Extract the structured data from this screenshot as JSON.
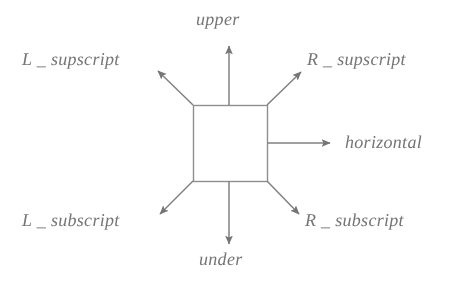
{
  "figure": {
    "background_color": "#ffffff",
    "ink_color": "#6e6e6e",
    "center_shape": {
      "kind": "square",
      "x": 193,
      "y": 105,
      "width": 74,
      "height": 76,
      "fill": "none"
    },
    "labels": {
      "upper": "upper",
      "under": "under",
      "horizontal": "horizontal",
      "left_supscript": "L _ supscript",
      "right_supscript": "R _ supscript",
      "left_subscript": "L _ subscript",
      "right_subscript": "R _ subscript"
    },
    "arrows": [
      {
        "name": "upper-arrow",
        "direction": "up",
        "from_x": 229,
        "from_y": 105,
        "to_x": 229,
        "to_y": 44
      },
      {
        "name": "under-arrow",
        "direction": "down",
        "from_x": 229,
        "from_y": 181,
        "to_x": 229,
        "to_y": 246
      },
      {
        "name": "horizontal-arrow",
        "direction": "right",
        "from_x": 267,
        "from_y": 143,
        "to_x": 332,
        "to_y": 143
      },
      {
        "name": "left-supscript-arrow",
        "direction": "up-left",
        "from_x": 193,
        "from_y": 105,
        "to_x": 156,
        "to_y": 69
      },
      {
        "name": "right-supscript-arrow",
        "direction": "up-right",
        "from_x": 267,
        "from_y": 105,
        "to_x": 303,
        "to_y": 70
      },
      {
        "name": "left-subscript-arrow",
        "direction": "down-left",
        "from_x": 193,
        "from_y": 181,
        "to_x": 158,
        "to_y": 216
      },
      {
        "name": "right-subscript-arrow",
        "direction": "down-right",
        "from_x": 267,
        "from_y": 181,
        "to_x": 301,
        "to_y": 216
      }
    ]
  }
}
